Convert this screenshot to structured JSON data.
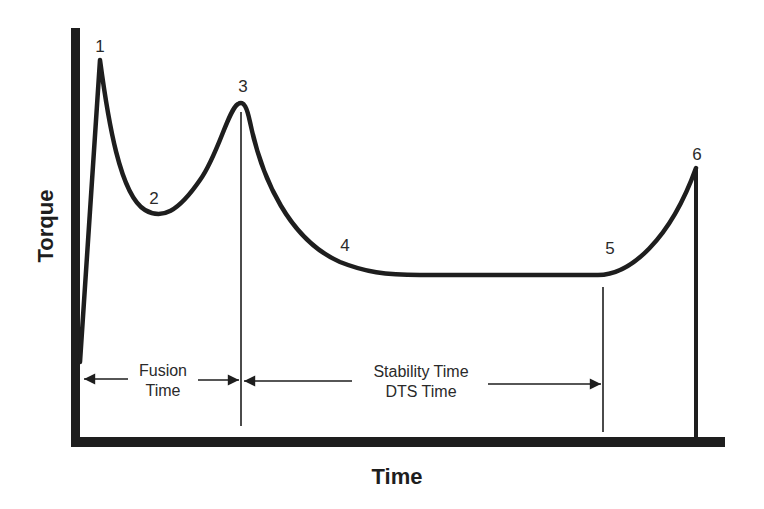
{
  "diagram": {
    "axes": {
      "x_label": "Time",
      "y_label": "Torque"
    },
    "points": [
      {
        "id": "1",
        "label": "1",
        "x": 100,
        "y": 60
      },
      {
        "id": "2",
        "label": "2",
        "x": 155,
        "y": 213
      },
      {
        "id": "3",
        "label": "3",
        "x": 242,
        "y": 102
      },
      {
        "id": "4",
        "label": "4",
        "x": 345,
        "y": 250
      },
      {
        "id": "5",
        "label": "5",
        "x": 603,
        "y": 275
      },
      {
        "id": "6",
        "label": "6",
        "x": 696,
        "y": 168
      }
    ],
    "spans": {
      "fusion": {
        "line1": "Fusion",
        "line2": "Time"
      },
      "stability": {
        "line1": "Stability Time",
        "line2": "DTS Time"
      }
    },
    "colors": {
      "ink": "#1e1e1e",
      "background": "#ffffff"
    }
  }
}
